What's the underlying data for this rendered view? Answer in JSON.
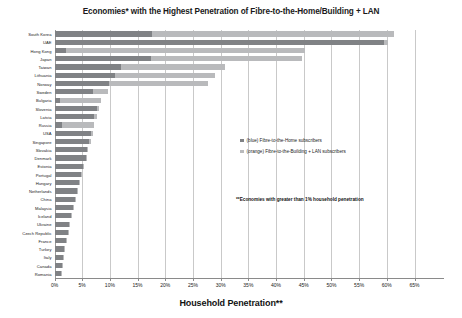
{
  "chart_data": {
    "type": "bar",
    "orientation": "horizontal",
    "stacked": true,
    "title": "Economies* with the Highest Penetration of Fibre-to-the-Home/Building + LAN",
    "xlabel": "Household Penetration**",
    "ylabel": "",
    "xlim": [
      0,
      65
    ],
    "xtick_labels": [
      "0%",
      "5%",
      "10%",
      "15%",
      "20%",
      "25%",
      "30%",
      "35%",
      "40%",
      "45%",
      "50%",
      "55%",
      "60%",
      "65%"
    ],
    "xticks": [
      0,
      5,
      10,
      15,
      20,
      25,
      30,
      35,
      40,
      45,
      50,
      55,
      60,
      65
    ],
    "grid": true,
    "legend_position": "inside-right",
    "annotation": "**Economies with greater than 1% household penetration",
    "categories": [
      "South Korea",
      "UAE",
      "Hong Kong",
      "Japan",
      "Taiwan",
      "Lithuania",
      "Norway",
      "Sweden",
      "Bulgaria",
      "Slovenia",
      "Latvia",
      "Russia",
      "USA",
      "Singapore",
      "Slovakia",
      "Denmark",
      "Estonia",
      "Portugal",
      "Hungary",
      "Netherlands",
      "China",
      "Malaysia",
      "Iceland",
      "Ukraine",
      "Czech Republic",
      "France",
      "Turkey",
      "Italy",
      "Canada",
      "Romania"
    ],
    "series": [
      {
        "name": "(blue) Fibre-to-the-Home subscribers",
        "color": "#808285",
        "values": [
          17.6,
          59.5,
          2.0,
          17.4,
          12.0,
          11.0,
          9.8,
          7.0,
          1.0,
          7.6,
          7.2,
          1.4,
          6.6,
          6.2,
          5.8,
          5.6,
          5.2,
          4.8,
          4.4,
          4.0,
          3.7,
          3.4,
          3.0,
          2.7,
          2.4,
          2.0,
          1.8,
          1.5,
          1.3,
          1.1
        ]
      },
      {
        "name": "(orange) Fibre-to-the-Building + LAN subscribers",
        "color": "#b9babc",
        "values": [
          43.7,
          0.7,
          43.3,
          27.2,
          18.7,
          18.0,
          18.0,
          2.7,
          7.4,
          0.4,
          0.4,
          5.8,
          0.4,
          0.4,
          0.3,
          0.2,
          0.2,
          0.2,
          0.2,
          0.2,
          0.1,
          0.1,
          0.1,
          0.1,
          0.1,
          0.1,
          0.1,
          0.1,
          0.1,
          0.1
        ]
      }
    ],
    "totals": [
      61.3,
      60.2,
      45.3,
      44.6,
      30.7,
      29.0,
      27.8,
      9.7,
      8.4,
      8.0,
      7.6,
      7.2,
      7.0,
      6.6,
      6.1,
      5.8,
      5.4,
      5.0,
      4.6,
      4.2,
      3.8,
      3.5,
      3.1,
      2.8,
      2.5,
      2.1,
      1.9,
      1.6,
      1.4,
      1.2
    ]
  }
}
